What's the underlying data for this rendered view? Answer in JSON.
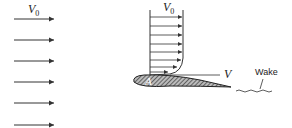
{
  "labels": {
    "freestream_velocity_left": {
      "symbol": "V",
      "subscript": "0"
    },
    "freestream_velocity_profile": {
      "symbol": "V",
      "subscript": "0"
    },
    "point_label": "A",
    "surface_velocity": "V",
    "wake": "Wake"
  },
  "diagram": {
    "freestream_arrow_count": 6,
    "profile_arrow_count": 8,
    "colors": {
      "line": "#333333",
      "airfoil_fill": "#555555"
    }
  }
}
